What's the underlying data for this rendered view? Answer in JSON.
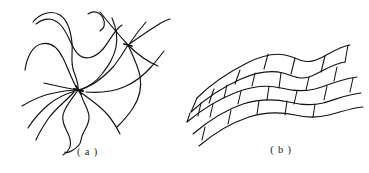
{
  "figure": {
    "background_color": "#ffffff",
    "ink_color": "#111111",
    "width": 369,
    "height": 173,
    "panels": [
      {
        "id": "a",
        "caption": "( a )",
        "subject": "crosslinked amorphous polymer network",
        "description": "Long wavy polymer chains radiating from crosslink junction points",
        "crosslink_nodes": [
          {
            "x": 78,
            "y": 90
          },
          {
            "x": 128,
            "y": 45
          }
        ],
        "chain_count": 11
      },
      {
        "id": "b",
        "caption": "( b )",
        "subject": "lamellar crystalline polymer structure",
        "description": "Stacked wavy lamellae subdivided by tie lines into offset brick-like cells",
        "band_count": 4,
        "tie_line_count": 17
      }
    ]
  }
}
